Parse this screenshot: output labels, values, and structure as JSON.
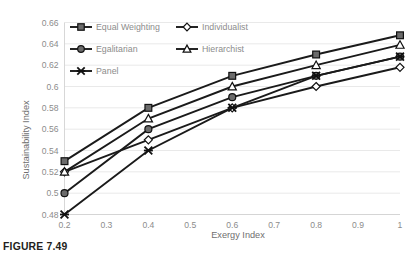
{
  "figure": {
    "caption": "FIGURE 7.49"
  },
  "chart_data": {
    "type": "line",
    "title": "",
    "xlabel": "Exergy Index",
    "ylabel": "Sustainability Index",
    "x": [
      0.2,
      0.4,
      0.6,
      0.8,
      1
    ],
    "xlim": [
      0.2,
      1
    ],
    "ylim": [
      0.48,
      0.66
    ],
    "xticks": [
      "0.2",
      "0.3",
      "0.4",
      "0.5",
      "0.6",
      "0.7",
      "0.8",
      "0.9",
      "1"
    ],
    "xtick_values": [
      0.2,
      0.3,
      0.4,
      0.5,
      0.6,
      0.7,
      0.8,
      0.9,
      1
    ],
    "yticks": [
      "0.48",
      "0.5",
      "0.52",
      "0.54",
      "0.56",
      "0.58",
      "0.6",
      "0.62",
      "0.64",
      "0.66"
    ],
    "ytick_values": [
      0.48,
      0.5,
      0.52,
      0.54,
      0.56,
      0.58,
      0.6,
      0.62,
      0.64,
      0.66
    ],
    "grid": true,
    "legend_position": "top-left-inside",
    "series": [
      {
        "name": "Equal Weighting",
        "marker": "filled-square",
        "values": [
          0.53,
          0.58,
          0.61,
          0.63,
          0.648
        ]
      },
      {
        "name": "Individualist",
        "marker": "open-diamond",
        "values": [
          0.52,
          0.55,
          0.58,
          0.6,
          0.618
        ]
      },
      {
        "name": "Egalitarian",
        "marker": "filled-circle",
        "values": [
          0.5,
          0.56,
          0.59,
          0.61,
          0.628
        ]
      },
      {
        "name": "Hierarchist",
        "marker": "open-triangle",
        "values": [
          0.52,
          0.57,
          0.6,
          0.62,
          0.639
        ]
      },
      {
        "name": "Panel",
        "marker": "cross",
        "values": [
          0.48,
          0.54,
          0.58,
          0.61,
          0.628
        ]
      }
    ]
  },
  "legend": {
    "items": [
      {
        "label": "Equal Weighting",
        "marker": "filled-square"
      },
      {
        "label": "Individualist",
        "marker": "open-diamond"
      },
      {
        "label": "Egalitarian",
        "marker": "filled-circle"
      },
      {
        "label": "Hierarchist",
        "marker": "open-triangle"
      },
      {
        "label": "Panel",
        "marker": "cross"
      }
    ]
  },
  "colors": {
    "line": "#1a1a1a",
    "marker_fill": "#6b6b6b",
    "grid": "#e3e3e3",
    "axis": "#d2d2d2",
    "tick_text": "#8c8c8c",
    "caption_text": "#231f20"
  }
}
